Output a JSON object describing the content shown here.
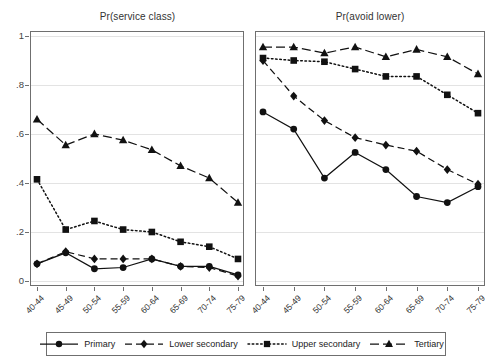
{
  "chart_data": {
    "type": "line",
    "multi_panel": true,
    "x": [
      "40-44",
      "45-49",
      "50-54",
      "55-59",
      "60-64",
      "65-69",
      "70-74",
      "75-79"
    ],
    "xlabel": "",
    "ylabel": "",
    "ylim": [
      0,
      1
    ],
    "yticks": [
      "0",
      ".2",
      ".4",
      ".6",
      ".8",
      "1"
    ],
    "ytick_values": [
      0,
      0.2,
      0.4,
      0.6,
      0.8,
      1
    ],
    "grid": true,
    "legend_position": "bottom",
    "panels": [
      {
        "title": "Pr(service class)",
        "series": [
          {
            "name": "Primary",
            "marker": "circle",
            "dash": "solid",
            "values": [
              0.07,
              0.115,
              0.05,
              0.055,
              0.09,
              0.06,
              0.06,
              0.025
            ]
          },
          {
            "name": "Lower secondary",
            "marker": "diamond",
            "dash": "dashed",
            "values": [
              0.07,
              0.12,
              0.09,
              0.09,
              0.09,
              0.06,
              0.055,
              0.02
            ]
          },
          {
            "name": "Upper secondary",
            "marker": "square",
            "dash": "dotted",
            "values": [
              0.415,
              0.21,
              0.245,
              0.21,
              0.2,
              0.16,
              0.14,
              0.09
            ]
          },
          {
            "name": "Tertiary",
            "marker": "triangle",
            "dash": "longdash",
            "values": [
              0.66,
              0.555,
              0.6,
              0.575,
              0.535,
              0.47,
              0.42,
              0.32
            ]
          }
        ]
      },
      {
        "title": "Pr(avoid lower)",
        "series": [
          {
            "name": "Primary",
            "marker": "circle",
            "dash": "solid",
            "values": [
              0.69,
              0.62,
              0.42,
              0.525,
              0.455,
              0.345,
              0.32,
              0.385
            ]
          },
          {
            "name": "Lower secondary",
            "marker": "diamond",
            "dash": "dashed",
            "values": [
              0.9,
              0.755,
              0.655,
              0.585,
              0.555,
              0.53,
              0.455,
              0.395
            ]
          },
          {
            "name": "Upper secondary",
            "marker": "square",
            "dash": "dotted",
            "values": [
              0.91,
              0.9,
              0.895,
              0.865,
              0.835,
              0.835,
              0.76,
              0.685
            ]
          },
          {
            "name": "Tertiary",
            "marker": "triangle",
            "dash": "longdash",
            "values": [
              0.955,
              0.955,
              0.93,
              0.955,
              0.915,
              0.945,
              0.915,
              0.845
            ]
          }
        ]
      }
    ],
    "legend": [
      {
        "label": "Primary",
        "marker": "circle",
        "dash": "solid"
      },
      {
        "label": "Lower secondary",
        "marker": "diamond",
        "dash": "dashed"
      },
      {
        "label": "Upper secondary",
        "marker": "square",
        "dash": "dotted"
      },
      {
        "label": "Tertiary",
        "marker": "triangle",
        "dash": "longdash"
      }
    ],
    "colors": {
      "ink": "#111111",
      "axis": "#6f6f6f",
      "grid": "#e3e3e3",
      "background": "#ffffff"
    }
  }
}
